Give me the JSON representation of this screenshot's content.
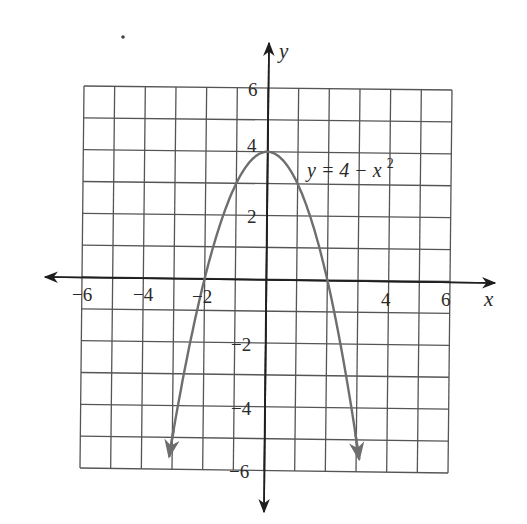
{
  "chart_data": {
    "type": "line",
    "title": "",
    "xlabel": "x",
    "ylabel": "y",
    "xlim": [
      -6,
      6
    ],
    "ylim": [
      -6,
      6
    ],
    "grid": true,
    "grid_step": 1,
    "x_ticks": [
      {
        "value": -6,
        "label": "−6"
      },
      {
        "value": -4,
        "label": "−4"
      },
      {
        "value": -2,
        "label": "−2"
      },
      {
        "value": 4,
        "label": "4"
      },
      {
        "value": 6,
        "label": "6"
      }
    ],
    "y_ticks": [
      {
        "value": 6,
        "label": "6"
      },
      {
        "value": 4,
        "label": "4"
      },
      {
        "value": 2,
        "label": "2"
      },
      {
        "value": -2,
        "label": "−2"
      },
      {
        "value": -4,
        "label": "−4"
      },
      {
        "value": -6,
        "label": "−6"
      }
    ],
    "series": [
      {
        "name": "y = 4 − x²",
        "function": "4 - x^2",
        "x": [
          -3.1,
          -3,
          -2.5,
          -2,
          -1.5,
          -1,
          -0.5,
          0,
          0.5,
          1,
          1.5,
          2,
          2.5,
          3,
          3.1
        ],
        "y": [
          -5.61,
          -5,
          -2.25,
          0,
          1.75,
          3,
          3.75,
          4,
          3.75,
          3,
          1.75,
          0,
          -2.25,
          -5,
          -5.61
        ],
        "color": "#6e6e6e",
        "end_arrows": true
      }
    ],
    "annotations": [
      {
        "text": "y = 4 − x",
        "superscript": "2",
        "x": 1.3,
        "y": 3.4
      }
    ]
  },
  "labels": {
    "x_axis": "x",
    "y_axis": "y",
    "equation_main": "y = 4 − x",
    "equation_sup": "2",
    "xt_m6": "−6",
    "xt_m4": "−4",
    "xt_m2": "−2",
    "xt_4": "4",
    "xt_6": "6",
    "yt_6": "6",
    "yt_4": "4",
    "yt_2": "2",
    "yt_m2": "−2",
    "yt_m4": "−4",
    "yt_m6": "−6"
  },
  "colors": {
    "grid": "#555555",
    "axis": "#1e1e1e",
    "curve": "#6e6e6e"
  }
}
